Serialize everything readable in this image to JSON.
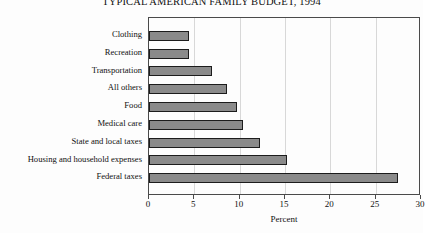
{
  "chart_data": {
    "type": "bar",
    "orientation": "horizontal",
    "title": "TYPICAL AMERICAN FAMILY BUDGET, 1994",
    "xlabel": "Percent",
    "ylabel": "",
    "xlim": [
      0,
      30
    ],
    "xticks": [
      0,
      5,
      10,
      15,
      20,
      25,
      30
    ],
    "xtick_labels": [
      "0",
      "5",
      "10",
      "15",
      "20",
      "25",
      "30"
    ],
    "grid": true,
    "grid_axis": "x",
    "legend": false,
    "bar_color": "#8a8a8a",
    "bar_edge_color": "#1c1c1c",
    "categories": [
      "Clothing",
      "Recreation",
      "Transportation",
      "All others",
      "Food",
      "Medical care",
      "State and local taxes",
      "Housing and household expenses",
      "Federal taxes"
    ],
    "values": [
      4.4,
      4.4,
      7.0,
      8.6,
      9.7,
      10.4,
      12.2,
      15.2,
      27.5
    ]
  }
}
